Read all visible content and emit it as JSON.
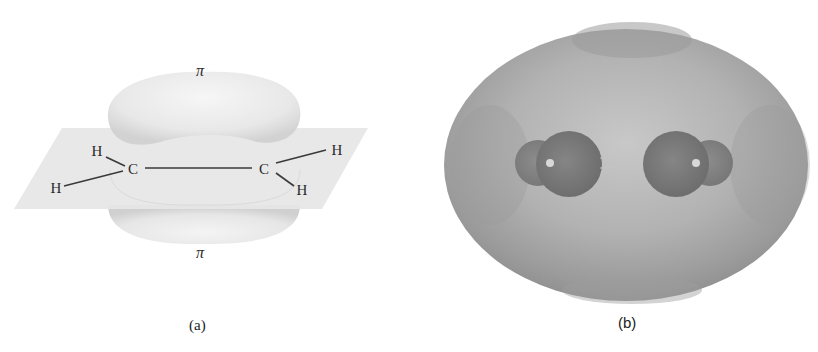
{
  "figure": {
    "panels": [
      {
        "id": "a",
        "caption": "(a)",
        "title_top": "π",
        "title_bottom": "π",
        "atoms": {
          "c_left": "C",
          "c_right": "C",
          "h_upper_left": "H",
          "h_lower_left": "H",
          "h_upper_right": "H",
          "h_lower_right": "H"
        },
        "description": "Ethylene molecule in a plane with pi electron clouds above and below"
      },
      {
        "id": "b",
        "caption": "(b)",
        "description": "Electron density surface of ethylene enclosing two C and four H atoms"
      }
    ],
    "colors": {
      "plane": "#e4e4e4",
      "lobe": "#ececec",
      "surface": "#a8a8a8",
      "atoms": "#808080"
    }
  }
}
